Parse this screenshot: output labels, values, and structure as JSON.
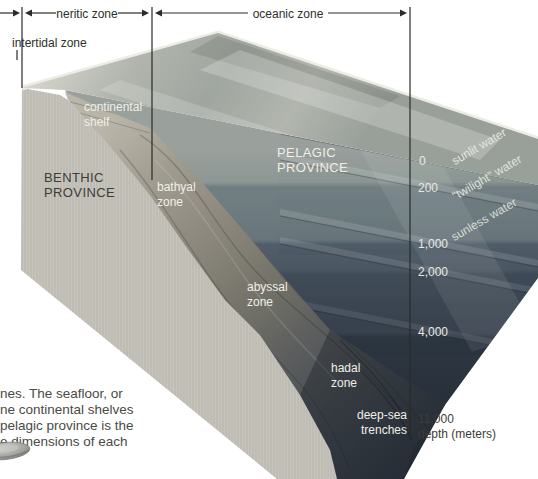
{
  "dimension_bar": {
    "neritic": "neritic zone",
    "oceanic": "oceanic zone",
    "intertidal": "intertidal zone"
  },
  "provinces": {
    "benthic_1": "BENTHIC",
    "benthic_2": "PROVINCE",
    "pelagic_1": "PELAGIC",
    "pelagic_2": "PROVINCE"
  },
  "seafloor_zones": {
    "shelf_1": "continental",
    "shelf_2": "shelf",
    "bathyal_1": "bathyal",
    "bathyal_2": "zone",
    "abyssal_1": "abyssal",
    "abyssal_2": "zone",
    "hadal_1": "hadal",
    "hadal_2": "zone",
    "trench_1": "deep-sea",
    "trench_2": "trenches"
  },
  "water_layers": {
    "sunlit": "sunlit water",
    "twilight": "\"twilight\" water",
    "sunless": "sunless water"
  },
  "depth_scale": {
    "d0": "0",
    "d200": "200",
    "d1000": "1,000",
    "d2000": "2,000",
    "d4000": "4,000",
    "d11000": "11,000",
    "unit_label": "depth (meters)"
  },
  "caption": {
    "line_1": "nes. The seafloor, or",
    "line_2": "ne continental shelves",
    "line_3": "pelagic province is the",
    "line_4": "e dimensions of each"
  },
  "colors": {
    "sea_surface": "#b4b8b0",
    "left_face": "#c6c4bd",
    "slope": "#8a867c",
    "deep_water": "#222a33",
    "label_light": "#f0efe8",
    "label_dark": "#3c3c38"
  }
}
